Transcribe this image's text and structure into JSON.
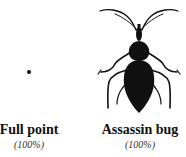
{
  "items": [
    {
      "name": "Full point",
      "scale": "(100%)",
      "icon": "dot-icon"
    },
    {
      "name": "Assassin bug",
      "scale": "(100%)",
      "icon": "assassin-bug-icon"
    }
  ],
  "colors": {
    "ink": "#111111",
    "background": "#ffffff"
  }
}
